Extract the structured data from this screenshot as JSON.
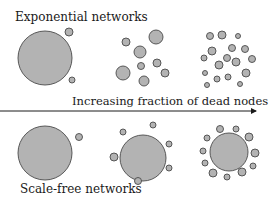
{
  "labels": {
    "top_title": "Exponential networks",
    "bottom_title": "Scale-free networks",
    "arrow_label": "Increasing fraction of dead nodes"
  },
  "colors": {
    "node_fill": "#b3b3b3",
    "node_stroke": "#4a4a4a",
    "text": "#1a1a1a",
    "background": "#ffffff"
  },
  "arrow": {
    "x1": 0,
    "y1": 111,
    "x2": 256,
    "y2": 111
  },
  "panels": {
    "exponential": [
      {
        "stage": 1,
        "nodes": [
          [
            45,
            58,
            27
          ],
          [
            69,
            32,
            4
          ],
          [
            72,
            80,
            3
          ]
        ]
      },
      {
        "stage": 2,
        "nodes": [
          [
            126,
            42,
            4
          ],
          [
            156,
            37,
            7
          ],
          [
            140,
            52,
            6
          ],
          [
            141,
            66,
            3.5
          ],
          [
            157,
            63,
            4
          ],
          [
            123,
            73,
            7
          ],
          [
            165,
            73,
            4
          ],
          [
            144,
            81,
            5
          ]
        ]
      },
      {
        "stage": 3,
        "nodes": [
          [
            210,
            36,
            3.5
          ],
          [
            222,
            35,
            4
          ],
          [
            238,
            36,
            2.5
          ],
          [
            212,
            51,
            4
          ],
          [
            232,
            48,
            3.5
          ],
          [
            245,
            49,
            3.5
          ],
          [
            204,
            58,
            3
          ],
          [
            227,
            58,
            3.5
          ],
          [
            236,
            62,
            4
          ],
          [
            219,
            65,
            4
          ],
          [
            252,
            59,
            3.5
          ],
          [
            205,
            73,
            2.5
          ],
          [
            217,
            79,
            3
          ],
          [
            228,
            77,
            3
          ],
          [
            246,
            73,
            4
          ],
          [
            207,
            85,
            2.5
          ],
          [
            240,
            84,
            2.5
          ]
        ]
      }
    ],
    "scale_free": [
      {
        "stage": 1,
        "nodes": [
          [
            45,
            153,
            27
          ],
          [
            79,
            137,
            3.5
          ]
        ]
      },
      {
        "stage": 2,
        "nodes": [
          [
            143,
            158,
            23
          ],
          [
            123,
            132,
            3
          ],
          [
            153,
            125,
            3
          ],
          [
            169,
            144,
            3
          ],
          [
            114,
            157,
            4
          ],
          [
            169,
            168,
            3
          ],
          [
            138,
            181,
            3.5
          ]
        ]
      },
      {
        "stage": 3,
        "nodes": [
          [
            229,
            152,
            19
          ],
          [
            220,
            129,
            3.5
          ],
          [
            236,
            129,
            3
          ],
          [
            249,
            137,
            4
          ],
          [
            207,
            138,
            3
          ],
          [
            203,
            151,
            3
          ],
          [
            255,
            153,
            4
          ],
          [
            205,
            163,
            3
          ],
          [
            253,
            166,
            3
          ],
          [
            213,
            173,
            4
          ],
          [
            242,
            172,
            4
          ],
          [
            227,
            177,
            3
          ]
        ]
      }
    ]
  }
}
